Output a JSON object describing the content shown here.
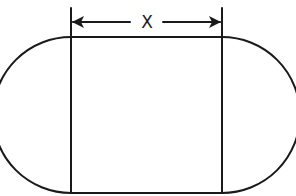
{
  "diagram": {
    "title": "",
    "shape": "stadium (rectangle with semicircular ends)",
    "dimension": {
      "label": "X",
      "measures": "width of central rectangle"
    },
    "colors": {
      "line": "#1a1a1a",
      "background": "#ffffff"
    }
  }
}
